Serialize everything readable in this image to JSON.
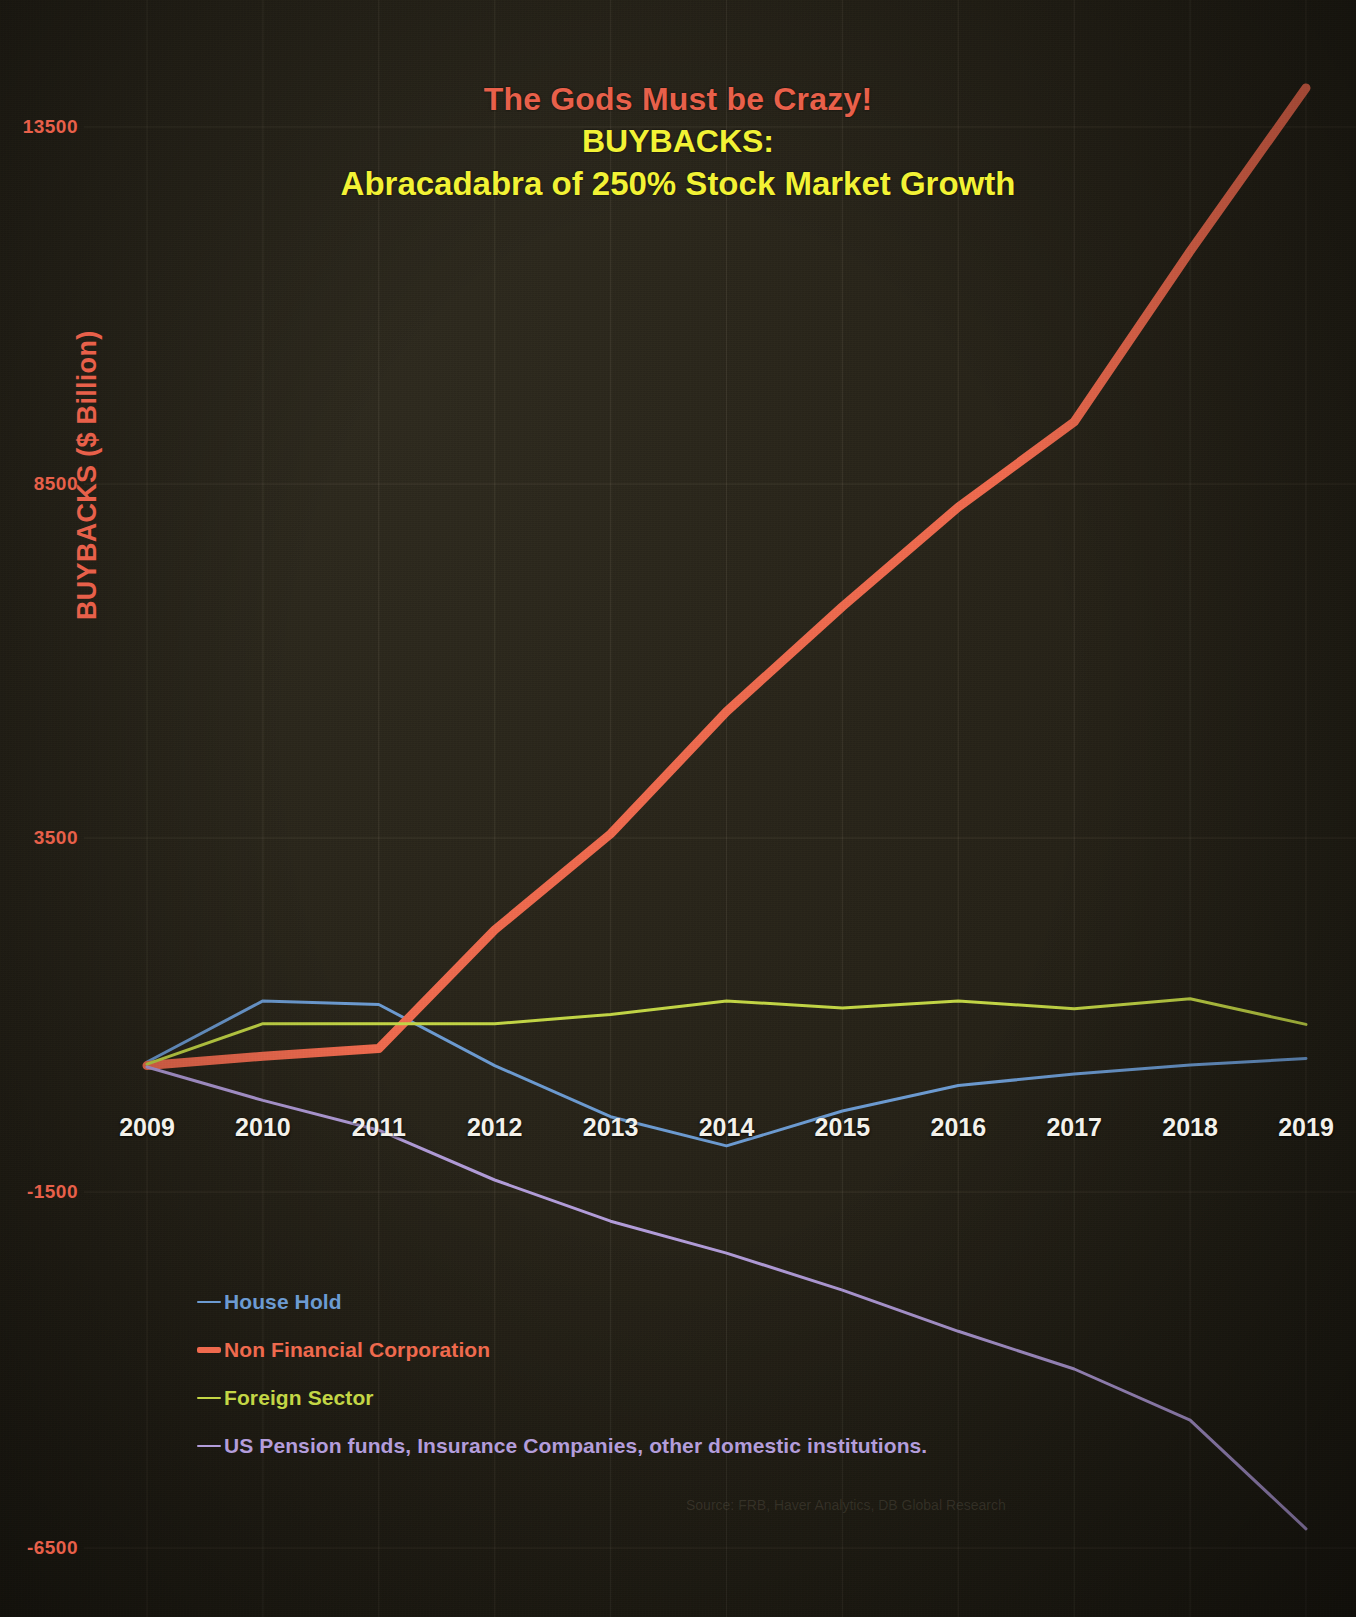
{
  "title": {
    "line1": "The Gods Must be Crazy!",
    "line2": "BUYBACKS:",
    "line3": "Abracadabra of 250% Stock Market Growth",
    "line1_color": "#e8604a",
    "line2_color": "#f2f235"
  },
  "source_note": "Source: FRB, Haver Analytics, DB Global Research",
  "legend": {
    "items": [
      {
        "label": "House Hold",
        "color": "#6c9bd2"
      },
      {
        "label": "Non Financial Corporation",
        "color": "#ef6a4e"
      },
      {
        "label": "Foreign Sector",
        "color": "#c3d645"
      },
      {
        "label": "US Pension funds, Insurance Companies, other domestic institutions.",
        "color": "#b39ddb"
      }
    ]
  },
  "chart_data": {
    "type": "line",
    "title": "The Gods Must be Crazy! BUYBACKS: Abracadabra of 250% Stock Market Growth",
    "xlabel": "",
    "ylabel": "BUYBACKS ($ Billion)",
    "x": [
      2009,
      2010,
      2011,
      2012,
      2013,
      2014,
      2015,
      2016,
      2017,
      2018,
      2019
    ],
    "xticklabels": [
      "2009",
      "2010",
      "2011",
      "2012",
      "2013",
      "2014",
      "2015",
      "2016",
      "2017",
      "2018",
      "2019"
    ],
    "yticks": [
      13500,
      8500,
      3500,
      -1500,
      -6500
    ],
    "yticklabels": [
      "13500",
      "8500",
      "3500",
      "-1500",
      "-6500"
    ],
    "ylim": [
      -6500,
      13500
    ],
    "xlim": [
      2009,
      2019
    ],
    "grid": true,
    "legend_position": "lower-left",
    "series": [
      {
        "name": "House Hold",
        "color": "#6c9bd2",
        "linewidth": 3,
        "values": [
          340,
          1200,
          1150,
          290,
          -430,
          -840,
          -350,
          10,
          170,
          300,
          390
        ]
      },
      {
        "name": "Non Financial Corporation",
        "color": "#ef6a4e",
        "linewidth": 9,
        "values": [
          290,
          420,
          530,
          2200,
          3550,
          5270,
          6750,
          8150,
          9350,
          11750,
          14050
        ]
      },
      {
        "name": "Foreign Sector",
        "color": "#c3d645",
        "linewidth": 3,
        "values": [
          310,
          880,
          880,
          880,
          1010,
          1200,
          1100,
          1200,
          1090,
          1230,
          870
        ]
      },
      {
        "name": "US Pension funds, Insurance Companies, other domestic institutions.",
        "color": "#b39ddb",
        "linewidth": 3,
        "values": [
          270,
          -200,
          -620,
          -1320,
          -1900,
          -2350,
          -2870,
          -3450,
          -3980,
          -4700,
          -6230
        ]
      }
    ]
  }
}
